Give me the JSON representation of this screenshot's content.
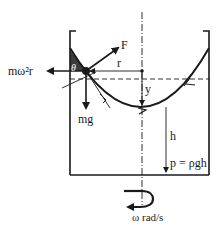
{
  "diagram": {
    "labels": {
      "centrifugal_force": "mω²r",
      "resultant_force": "F",
      "angle": "θ",
      "radius": "r",
      "rise_height": "y",
      "weight": "mg",
      "depth": "h",
      "pressure": "p = ρgh",
      "rotation": "ω rad/s"
    },
    "colors": {
      "ink": "#1a1a1a",
      "background": "#ffffff"
    }
  }
}
